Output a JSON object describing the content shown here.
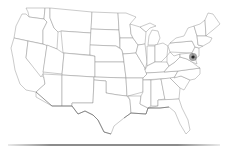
{
  "map": {
    "region": "United States (contiguous)",
    "style": "outline",
    "colors": {
      "background": "#ffffff",
      "state_fill": "#ffffff",
      "state_stroke": "#8a8a8a",
      "marker": "#222222"
    },
    "marker": {
      "icon": "location-marker-icon",
      "x": 193,
      "y": 57,
      "area": "Pennsylvania / Maryland border"
    }
  }
}
